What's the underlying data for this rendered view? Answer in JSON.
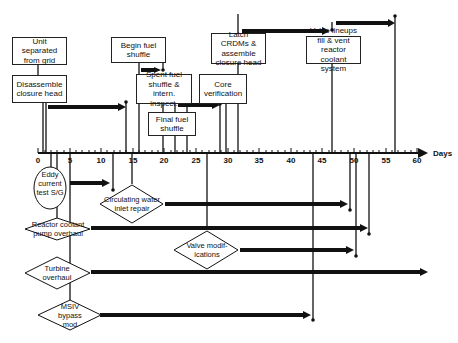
{
  "axis": {
    "title": "Days",
    "ticks": [
      "0",
      "5",
      "10",
      "15",
      "20",
      "25",
      "30",
      "35",
      "40",
      "45",
      "50",
      "55",
      "60"
    ]
  },
  "boxes": {
    "unit_separated": "Unit separated from grid",
    "disassemble_head": "Disassemble closure head",
    "begin_fuel_shuffle": "Begin fuel shuffle",
    "spent_fuel_shuffle": "Spent fuel shuffle & intern. inspect.",
    "final_fuel_shuffle": "Final fuel shuffle",
    "core_verification": "Core verification",
    "latch_crdms": "Latch CRDMs & assemble closure head",
    "valve_lineups": "Valve lineups fill & vent reactor coolant system"
  },
  "ellipse": {
    "eddy_current": "Eddy current test S/G"
  },
  "diamonds": {
    "circulating_water": "Circulating water inlet repair",
    "reactor_coolant_pump": "Reactor coolant pump overhaul",
    "valve_modifications": "Valve modif- ications",
    "turbine_overhaul": "Turbine overhaul",
    "msiv_bypass": "MSIV bypass mod"
  }
}
